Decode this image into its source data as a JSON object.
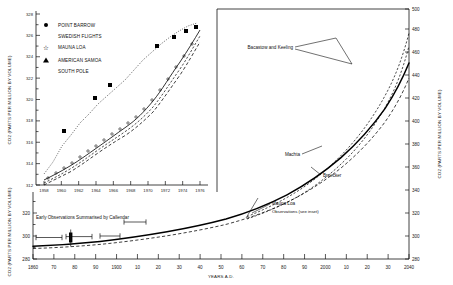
{
  "figure": {
    "title": "",
    "background": "#ffffff",
    "ink_color": "#000000"
  },
  "main_axes": {
    "ylabel": "CO2 (PARTS PER MILLION BY VOLUME)",
    "ylabel_right": "CO2 (PARTS PER MILLION BY VOLUME)",
    "xlabel": "YEARS A.D.",
    "xticklabels": [
      "1860",
      "70",
      "80",
      "90",
      "1900",
      "10",
      "20",
      "30",
      "40",
      "50",
      "60",
      "70",
      "80",
      "90",
      "2000",
      "10",
      "20",
      "30",
      "2040"
    ],
    "yticklabels_left": [
      "280",
      "300",
      "320"
    ],
    "yticklabels_right": [
      "280",
      "300",
      "320",
      "340",
      "360",
      "380",
      "400",
      "420",
      "440",
      "460",
      "480",
      "500"
    ]
  },
  "inset_axes": {
    "ylabel": "CO2 (PARTS PER MILLION BY VOLUME)",
    "yticklabels": [
      "312",
      "314",
      "316",
      "318",
      "320",
      "322",
      "324",
      "326",
      "328"
    ],
    "xticklabels": [
      "1958",
      "1960",
      "1962",
      "1964",
      "1966",
      "1968",
      "1970",
      "1972",
      "1974",
      "1976"
    ]
  },
  "legend": {
    "items": [
      {
        "label": "POINT BARROW",
        "symbol": "filled-circle"
      },
      {
        "label": "SWEDISH FLIGHTS",
        "symbol": "none"
      },
      {
        "label": "MAUNA LOA",
        "symbol": "open-star"
      },
      {
        "label": "AMERICAN SAMOA",
        "symbol": "filled-triangle"
      },
      {
        "label": "SOUTH POLE",
        "symbol": "none"
      }
    ]
  },
  "annotations": {
    "bacastow_keeling": "Bacastow and Keeling",
    "machta": "Machta",
    "broecker": "Broecker",
    "mauna_loa_line1": "Mauna Loa",
    "mauna_loa_line2": "Observations (see inset)",
    "callendar": "Early Observations Summarised by Callendar"
  },
  "chart_data": {
    "type": "line",
    "xlabel": "YEARS A.D.",
    "ylabel": "CO2 (PARTS PER MILLION BY VOLUME)",
    "xlim": [
      1860,
      2040
    ],
    "ylim": [
      280,
      500
    ],
    "grid": false,
    "legend_position": "inset-top-left",
    "series": [
      {
        "name": "Machta",
        "style": "solid-thick",
        "x": [
          1860,
          1880,
          1900,
          1920,
          1940,
          1958,
          1970,
          1980,
          1990,
          2000,
          2010,
          2020,
          2030,
          2040
        ],
        "values": [
          292,
          293,
          296,
          300,
          306,
          315,
          325,
          334,
          346,
          361,
          380,
          404,
          434,
          470
        ]
      },
      {
        "name": "Broecker",
        "style": "dashed",
        "x": [
          1860,
          1880,
          1900,
          1920,
          1940,
          1958,
          1970,
          1980,
          1990,
          2000,
          2010,
          2020,
          2030,
          2040
        ],
        "values": [
          290,
          291,
          294,
          298,
          303,
          312,
          322,
          330,
          341,
          355,
          373,
          396,
          425,
          462
        ]
      },
      {
        "name": "Bacastow and Keeling (upper)",
        "style": "dashed-fine",
        "x": [
          1958,
          1970,
          1980,
          1990,
          2000,
          2010,
          2020,
          2030,
          2040
        ],
        "values": [
          315,
          327,
          338,
          353,
          372,
          397,
          428,
          463,
          500
        ]
      },
      {
        "name": "Bacastow and Keeling (lower)",
        "style": "dashed-fine",
        "x": [
          1958,
          1970,
          1980,
          1990,
          2000,
          2010,
          2020,
          2030,
          2040
        ],
        "values": [
          314,
          324,
          334,
          347,
          364,
          386,
          414,
          448,
          487
        ]
      },
      {
        "name": "Early Observations Summarised by Callendar",
        "style": "error-bars",
        "x": [
          1870,
          1880,
          1890,
          1900,
          1910
        ],
        "values": [
          292,
          291,
          293,
          294,
          296
        ]
      }
    ],
    "inset": {
      "type": "line",
      "title": "Mauna Loa and station observations 1958-1976",
      "xlabel": "",
      "ylabel": "CO2 (PARTS PER MILLION BY VOLUME)",
      "xlim": [
        1957,
        1977
      ],
      "ylim": [
        312,
        328
      ],
      "grid": false,
      "series": [
        {
          "name": "POINT BARROW",
          "marker": "filled-circle",
          "x": [
            1962,
            1964,
            1966,
            1968,
            1971,
            1973,
            1974,
            1975
          ],
          "values": [
            318.2,
            319.4,
            321.0,
            321.9,
            325.2,
            326.3,
            326.9,
            327.2
          ]
        },
        {
          "name": "SWEDISH FLIGHTS",
          "marker": "none",
          "style": "dotted",
          "x": [
            1958,
            1960,
            1962,
            1964,
            1966,
            1968,
            1970,
            1972,
            1974,
            1976
          ],
          "values": [
            313.8,
            315.3,
            317.8,
            319.6,
            321.2,
            322.6,
            324.2,
            325.6,
            326.6,
            327.4
          ]
        },
        {
          "name": "MAUNA LOA",
          "marker": "open-star",
          "style": "solid",
          "x": [
            1958,
            1960,
            1962,
            1964,
            1966,
            1968,
            1970,
            1972,
            1974,
            1976
          ],
          "values": [
            313.0,
            314.0,
            315.6,
            316.9,
            318.4,
            319.9,
            321.5,
            323.4,
            325.3,
            326.8
          ]
        },
        {
          "name": "AMERICAN SAMOA",
          "marker": "filled-triangle",
          "style": "dash-dot",
          "x": [
            1958,
            1960,
            1962,
            1964,
            1966,
            1968,
            1970,
            1972,
            1974,
            1976
          ],
          "values": [
            312.6,
            313.6,
            315.2,
            316.5,
            318.0,
            319.4,
            321.0,
            322.8,
            324.6,
            326.2
          ]
        },
        {
          "name": "SOUTH POLE",
          "marker": "none",
          "style": "dashed",
          "x": [
            1958,
            1960,
            1962,
            1964,
            1966,
            1968,
            1970,
            1972,
            1974,
            1976
          ],
          "values": [
            312.3,
            313.2,
            314.8,
            316.1,
            317.6,
            319.0,
            320.6,
            322.4,
            324.2,
            325.8
          ]
        }
      ]
    }
  }
}
